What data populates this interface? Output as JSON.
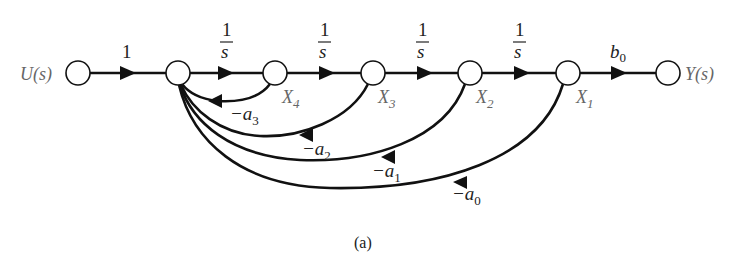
{
  "figure": {
    "caption": "(a)",
    "type": "signal-flow-graph"
  },
  "nodes": [
    {
      "id": "U",
      "label": "U(s)",
      "x": 78,
      "y": 73
    },
    {
      "id": "N1",
      "label": "",
      "x": 178,
      "y": 73
    },
    {
      "id": "X4",
      "label": "X",
      "sub": "4",
      "x": 275,
      "y": 73
    },
    {
      "id": "X3",
      "label": "X",
      "sub": "3",
      "x": 373,
      "y": 73
    },
    {
      "id": "X2",
      "label": "X",
      "sub": "2",
      "x": 470,
      "y": 73
    },
    {
      "id": "X1",
      "label": "X",
      "sub": "1",
      "x": 568,
      "y": 73
    },
    {
      "id": "Y",
      "label": "Y(s)",
      "x": 668,
      "y": 73
    }
  ],
  "forward_edges": [
    {
      "from": "U",
      "to": "N1",
      "gain": "1"
    },
    {
      "from": "N1",
      "to": "X4",
      "gain_num": "1",
      "gain_den": "s"
    },
    {
      "from": "X4",
      "to": "X3",
      "gain_num": "1",
      "gain_den": "s"
    },
    {
      "from": "X3",
      "to": "X2",
      "gain_num": "1",
      "gain_den": "s"
    },
    {
      "from": "X2",
      "to": "X1",
      "gain_num": "1",
      "gain_den": "s"
    },
    {
      "from": "X1",
      "to": "Y",
      "gain": "b",
      "gain_sub": "0"
    }
  ],
  "feedback_edges": [
    {
      "from": "X4",
      "to": "N1",
      "gain": "−a",
      "gain_sub": "3"
    },
    {
      "from": "X3",
      "to": "N1",
      "gain": "−a",
      "gain_sub": "2"
    },
    {
      "from": "X2",
      "to": "N1",
      "gain": "−a",
      "gain_sub": "1"
    },
    {
      "from": "X1",
      "to": "N1",
      "gain": "−a",
      "gain_sub": "0"
    }
  ],
  "labels": {
    "input": "U(s)",
    "output": "Y(s)",
    "x4": "X",
    "x4_sub": "4",
    "x3": "X",
    "x3_sub": "3",
    "x2": "X",
    "x2_sub": "2",
    "x1": "X",
    "x1_sub": "1",
    "g_u": "1",
    "one": "1",
    "s": "s",
    "b": "b",
    "b_sub": "0",
    "minus_a": "−a",
    "a3_sub": "3",
    "a2_sub": "2",
    "a1_sub": "1",
    "a0_sub": "0"
  }
}
